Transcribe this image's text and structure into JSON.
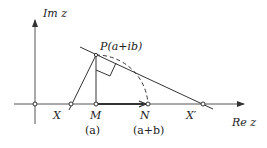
{
  "diagram": {
    "type": "complex-plane-construction",
    "axes": {
      "x_label": "Re z",
      "y_label": "Im z"
    },
    "points": {
      "P": "P(a+ib)",
      "X": "X",
      "M": "M",
      "N": "N",
      "X_prime": "X′"
    },
    "sublabels": {
      "M": "(a)",
      "N": "(a+b)"
    },
    "colors": {
      "stroke": "#333333",
      "axis": "#555555",
      "background": "#ffffff"
    }
  }
}
